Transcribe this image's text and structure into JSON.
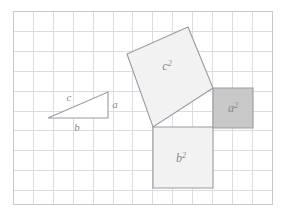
{
  "figure": {
    "canvas": {
      "width": 292,
      "height": 217,
      "background": "#ffffff"
    }
  },
  "grid": {
    "x": 13,
    "y": 11,
    "width": 259,
    "height": 193,
    "cell_size": 19.9,
    "columns": 13,
    "rows": 10,
    "line_color": "#dcdce4",
    "border_color": "#c9c9d4"
  },
  "labels": {
    "side_a": "a",
    "side_b": "b",
    "side_c": "c",
    "square_a_base": "a",
    "square_a_exp": "2",
    "square_b_base": "b",
    "square_b_exp": "2",
    "square_c_base": "c",
    "square_c_exp": "2"
  },
  "colors": {
    "stroke": "#9a9aa4",
    "triangle_fill": "#ffffff",
    "square_c_fill": "#f2f2f2",
    "square_b_fill": "#f2f2f2",
    "square_a_fill": "#c8c8c8",
    "label_color": "#8a8a94"
  },
  "shapes": {
    "triangle": {
      "name": "right-triangle",
      "points": "48,118 108,118 108,92",
      "vertices": [
        [
          48,
          118
        ],
        [
          108,
          118
        ],
        [
          108,
          92
        ]
      ]
    },
    "square_c": {
      "name": "square-on-hypotenuse",
      "points": "188,27 213,88 153,127 127,54",
      "vertices": [
        [
          188,
          27
        ],
        [
          213,
          88
        ],
        [
          153,
          127
        ],
        [
          127,
          54
        ]
      ],
      "label_x": 167,
      "label_y": 70
    },
    "square_b": {
      "name": "square-on-leg-b",
      "points": "153,127 213,127 213,188 153,188",
      "vertices": [
        [
          153,
          127
        ],
        [
          213,
          127
        ],
        [
          213,
          188
        ],
        [
          153,
          188
        ]
      ],
      "label_x": 181,
      "label_y": 162
    },
    "square_a": {
      "name": "square-on-leg-a",
      "points": "213,88 253,88 253,128 213,128",
      "vertices": [
        [
          213,
          88
        ],
        [
          253,
          88
        ],
        [
          253,
          128
        ],
        [
          213,
          128
        ]
      ],
      "label_x": 233,
      "label_y": 112
    },
    "label_positions": {
      "a": {
        "x": 115,
        "y": 108
      },
      "b": {
        "x": 77,
        "y": 131
      },
      "c": {
        "x": 69,
        "y": 101
      }
    }
  },
  "chart_data": {
    "type": "diagram",
    "elements": [
      {
        "name": "right-triangle",
        "legs": [
          "a",
          "b"
        ],
        "hypotenuse": "c"
      },
      {
        "name": "square-a",
        "label": "a²",
        "side_units": 2,
        "fill": "#c8c8c8"
      },
      {
        "name": "square-b",
        "label": "b²",
        "side_units": 3,
        "fill": "#f2f2f2"
      },
      {
        "name": "square-c",
        "label": "c²",
        "side_units": 3.6,
        "fill": "#f2f2f2"
      }
    ],
    "grid": {
      "columns": 13,
      "rows": 10,
      "on": true
    }
  }
}
